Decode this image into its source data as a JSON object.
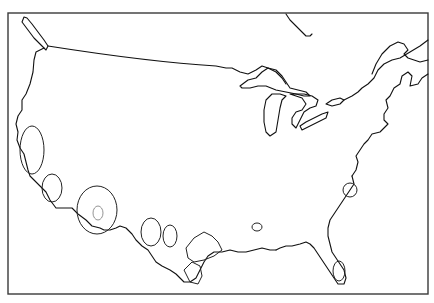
{
  "map": {
    "subject": "Contiguous United States outline",
    "style": "black line drawing on white",
    "colors": {
      "background": "#ffffff",
      "outline": "#111111",
      "frame": "#3a3a3a",
      "region_outline": "#222222"
    },
    "frame": {
      "x": 8,
      "y": 13,
      "width": 420,
      "height": 281
    },
    "features": [
      {
        "name": "pacific-coast"
      },
      {
        "name": "northern-border-49th-parallel"
      },
      {
        "name": "great-lakes"
      },
      {
        "name": "atlantic-coast"
      },
      {
        "name": "gulf-coast"
      },
      {
        "name": "florida-peninsula"
      },
      {
        "name": "hudson-bay-fragment"
      },
      {
        "name": "gulf-of-st-lawrence"
      },
      {
        "name": "vancouver-island"
      }
    ],
    "highlighted_regions": [
      {
        "name": "northern-california-region"
      },
      {
        "name": "southern-california-region"
      },
      {
        "name": "arizona-region"
      },
      {
        "name": "arizona-inner-region"
      },
      {
        "name": "new-mexico-region-west"
      },
      {
        "name": "new-mexico-region-east"
      },
      {
        "name": "texas-region"
      },
      {
        "name": "south-texas-region"
      },
      {
        "name": "louisiana-inland-region"
      },
      {
        "name": "chesapeake-region"
      },
      {
        "name": "south-florida-region"
      }
    ],
    "labels": []
  }
}
